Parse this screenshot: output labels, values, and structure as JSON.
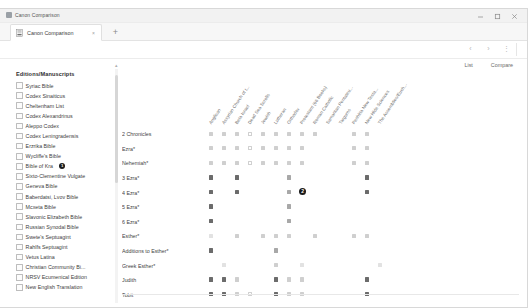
{
  "window": {
    "title": "Canon Comparison",
    "app_icon": "app-icon",
    "minimize": "–",
    "maximize": "□",
    "close": "✕"
  },
  "tabbar": {
    "tab_label": "Canon Comparison",
    "tab_close": "×",
    "new_tab": "+"
  },
  "toolbar": {
    "back": "‹",
    "forward": "›",
    "menu": "⋮"
  },
  "view_tabs": [
    {
      "label": "List",
      "active": false
    },
    {
      "label": "Compare",
      "active": true
    }
  ],
  "sidebar": {
    "title": "Editions/Manuscripts",
    "scroll_up": "▴",
    "items": [
      {
        "label": "Syriac Bible",
        "checked": false,
        "badge": null
      },
      {
        "label": "Codex Sinaiticus",
        "checked": false,
        "badge": null
      },
      {
        "label": "Cheltenham List",
        "checked": false,
        "badge": null
      },
      {
        "label": "Codex Alexandrinus",
        "checked": false,
        "badge": null
      },
      {
        "label": "Aleppo Codex",
        "checked": false,
        "badge": null
      },
      {
        "label": "Codex Leningradensis",
        "checked": false,
        "badge": null
      },
      {
        "label": "Erzrika Bible",
        "checked": false,
        "badge": null
      },
      {
        "label": "Wycliffe's Bible",
        "checked": false,
        "badge": null
      },
      {
        "label": "Bible of Kra",
        "checked": false,
        "badge": "1"
      },
      {
        "label": "Sixto-Clementine Vulgate",
        "checked": false,
        "badge": null
      },
      {
        "label": "Geneva Bible",
        "checked": false,
        "badge": null
      },
      {
        "label": "Baberdatsi, Lvov Bible",
        "checked": false,
        "badge": null
      },
      {
        "label": "Mcxeta Bible",
        "checked": false,
        "badge": null
      },
      {
        "label": "Slavonic Elizabeth Bible",
        "checked": false,
        "badge": null
      },
      {
        "label": "Russian Synodal Bible",
        "checked": false,
        "badge": null
      },
      {
        "label": "Swete's Septuagint",
        "checked": false,
        "badge": null
      },
      {
        "label": "Rahlfs Septuagint",
        "checked": false,
        "badge": null
      },
      {
        "label": "Vetus Latina",
        "checked": false,
        "badge": null
      },
      {
        "label": "Christian Community Bi...",
        "checked": false,
        "badge": null
      },
      {
        "label": "NRSV Ecumenical Edition",
        "checked": false,
        "badge": null
      },
      {
        "label": "New English Translation",
        "checked": false,
        "badge": null
      }
    ]
  },
  "grid": {
    "columns": [
      "Anglican",
      "Assyrian Church of t...",
      "Beta Israel",
      "Dead Sea Scrolls",
      "Jewish",
      "Lutheran",
      "Orthodox",
      "Protestant (66 Books)",
      "Roman Catholic",
      "Samaritan Pentateu...",
      "Targums",
      "Peshitta New Testa...",
      "New Hide Sciences",
      "The Assemblies/Euch..."
    ],
    "rows": [
      {
        "book": "2 Chronicles",
        "cells": [
          "light",
          "light",
          "light",
          "empty",
          "light",
          "light",
          "light",
          "light",
          "light",
          "",
          "",
          "light",
          "light",
          ""
        ]
      },
      {
        "book": "Ezra*",
        "cells": [
          "light",
          "light",
          "light",
          "empty",
          "light",
          "light",
          "light",
          "light",
          "",
          "",
          "",
          "light",
          "light",
          ""
        ]
      },
      {
        "book": "Nehemiah*",
        "cells": [
          "light",
          "light",
          "light",
          "empty",
          "light",
          "light",
          "light",
          "light",
          "",
          "",
          "",
          "light",
          "light",
          ""
        ]
      },
      {
        "book": "3 Ezra*",
        "cells": [
          "dark",
          "",
          "dark",
          "",
          "",
          "",
          "mid",
          "",
          "",
          "",
          "",
          "",
          "dark",
          ""
        ]
      },
      {
        "book": "4 Ezra*",
        "cells": [
          "dark",
          "",
          "dark",
          "",
          "",
          "",
          "mid",
          "badge2",
          "",
          "",
          "",
          "",
          "dark",
          ""
        ]
      },
      {
        "book": "5 Ezra*",
        "cells": [
          "dark",
          "",
          "",
          "",
          "",
          "",
          "mid",
          "",
          "",
          "",
          "",
          "",
          "",
          ""
        ]
      },
      {
        "book": "6 Ezra*",
        "cells": [
          "dark",
          "",
          "",
          "",
          "",
          "",
          "mid",
          "",
          "",
          "",
          "",
          "",
          "",
          ""
        ]
      },
      {
        "book": "Esther*",
        "cells": [
          "faint",
          "",
          "light",
          "",
          "light",
          "light",
          "light",
          "",
          "light",
          "",
          "",
          "light",
          "light",
          ""
        ]
      },
      {
        "book": "Additions to Esther*",
        "cells": [
          "dark",
          "",
          "",
          "",
          "",
          "mid",
          "",
          "",
          "",
          "",
          "",
          "",
          "",
          ""
        ]
      },
      {
        "book": "Greek Esther*",
        "cells": [
          "",
          "faint",
          "",
          "",
          "",
          "light",
          "",
          "faint",
          "",
          "",
          "",
          "",
          "",
          "faint"
        ]
      },
      {
        "book": "Judith",
        "cells": [
          "dark",
          "dark",
          "light",
          "",
          "",
          "dark",
          "light",
          "light",
          "",
          "",
          "",
          "",
          "dark",
          ""
        ]
      },
      {
        "book": "Tobit",
        "cells": [
          "dark",
          "dark",
          "light",
          "empty",
          "",
          "dark",
          "light",
          "light",
          "",
          "",
          "",
          "",
          "dark",
          ""
        ]
      },
      {
        "book": "1 Maccabees",
        "cells": [
          "dark",
          "dark",
          "",
          "",
          "",
          "dark",
          "light",
          "light",
          "",
          "",
          "",
          "",
          "dark",
          ""
        ]
      },
      {
        "book": "2 Maccabees",
        "cells": [
          "dark",
          "dark",
          "",
          "",
          "",
          "dark",
          "light",
          "light",
          "",
          "",
          "",
          "",
          "dark",
          ""
        ]
      },
      {
        "book": "3 Maccabees",
        "cells": [
          "",
          "dark",
          "",
          "",
          "",
          "",
          "light",
          "",
          "",
          "",
          "",
          "",
          "dark",
          ""
        ]
      }
    ]
  }
}
